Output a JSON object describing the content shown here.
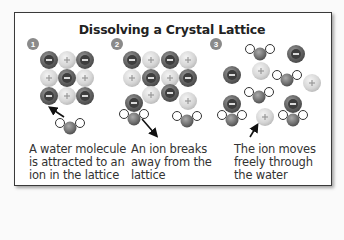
{
  "title": "Dissolving a Crystal Lattice",
  "colors": {
    "frame_border": "#3a3a3a",
    "negative_ion": "#6a6a6a",
    "positive_ion": "#dcdcdc",
    "badge": "#8a8a8a",
    "text": "#333333"
  },
  "steps": [
    {
      "number": "1",
      "caption": [
        "A water molecule",
        "is attracted to an",
        "ion in the lattice"
      ]
    },
    {
      "number": "2",
      "caption": [
        "An ion breaks",
        "away from the",
        "lattice"
      ]
    },
    {
      "number": "3",
      "caption": [
        "The ion moves",
        "freely through",
        "the water"
      ]
    }
  ],
  "symbols": {
    "negative": "−",
    "positive": "+"
  }
}
